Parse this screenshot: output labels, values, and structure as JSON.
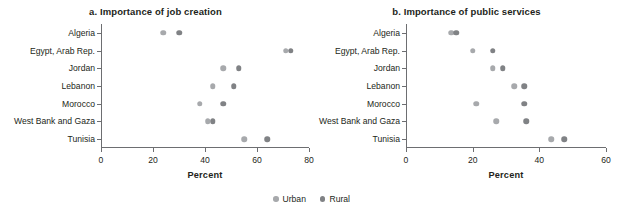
{
  "chart_data": [
    {
      "type": "scatter",
      "title": "a. Importance of job creation",
      "xlabel": "Percent",
      "ylabel": "",
      "xlim": [
        0,
        80
      ],
      "xticks": [
        0,
        20,
        40,
        60,
        80
      ],
      "xticklabels": [
        "0",
        "20",
        "40",
        "60",
        "80"
      ],
      "categories": [
        "Algeria",
        "Egypt, Arab Rep.",
        "Jordan",
        "Lebanon",
        "Morocco",
        "West Bank and Gaza",
        "Tunisia"
      ],
      "grid": false,
      "legend_position": "bottom-center",
      "series": [
        {
          "name": "Urban",
          "color": "#a7a9ac",
          "values": [
            24,
            71,
            47,
            43,
            38,
            41,
            55
          ]
        },
        {
          "name": "Rural",
          "color": "#808285",
          "values": [
            30,
            73,
            53,
            51,
            47,
            43,
            64
          ]
        }
      ]
    },
    {
      "type": "scatter",
      "title": "b. Importance of public services",
      "xlabel": "Percent",
      "ylabel": "",
      "xlim": [
        0,
        60
      ],
      "xticks": [
        0,
        20,
        40,
        60
      ],
      "xticklabels": [
        "0",
        "20",
        "40",
        "60"
      ],
      "categories": [
        "Algeria",
        "Egypt, Arab Rep.",
        "Jordan",
        "Lebanon",
        "Morocco",
        "West Bank and Gaza",
        "Tunisia"
      ],
      "grid": false,
      "legend_position": "bottom-center",
      "series": [
        {
          "name": "Urban",
          "color": "#a7a9ac",
          "values": [
            13.5,
            20,
            26,
            32.5,
            21,
            27,
            43.5
          ]
        },
        {
          "name": "Rural",
          "color": "#808285",
          "values": [
            15,
            26,
            29,
            35.5,
            35.5,
            36,
            47.5
          ]
        }
      ]
    }
  ],
  "legend": {
    "items": [
      {
        "label": "Urban",
        "color": "#a7a9ac"
      },
      {
        "label": "Rural",
        "color": "#808285"
      }
    ]
  }
}
